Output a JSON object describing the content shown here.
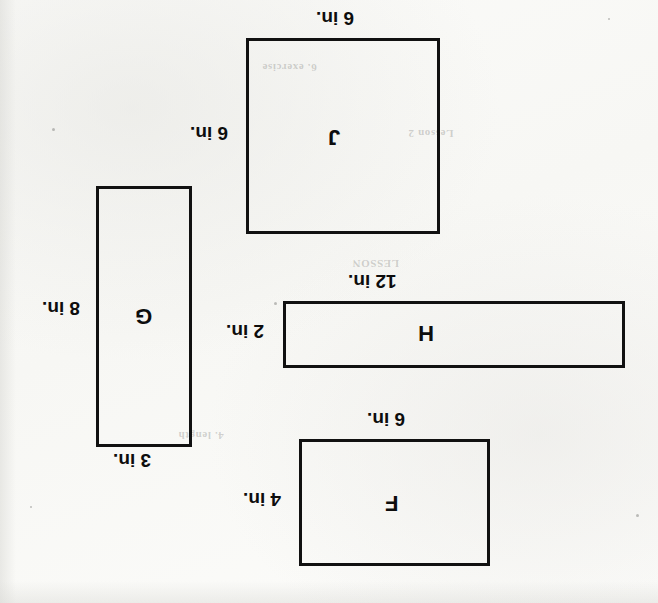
{
  "page": {
    "orientation": "upside-down-scan",
    "width": 658,
    "height": 603,
    "background_color": "#fdfdfb",
    "ink_color": "#111111"
  },
  "figures": [
    {
      "id": "figure-j",
      "letter": "J",
      "shape": "square",
      "top_label": "6 in.",
      "side_label": "6 in.",
      "box": {
        "x": 246,
        "y": 38,
        "w": 194,
        "h": 196
      }
    },
    {
      "id": "figure-g",
      "letter": "G",
      "shape": "rectangle",
      "top_label": "3 in.",
      "side_label": "8 in.",
      "box": {
        "x": 96,
        "y": 186,
        "w": 96,
        "h": 261
      }
    },
    {
      "id": "figure-h",
      "letter": "H",
      "shape": "rectangle",
      "top_label": "12 in.",
      "side_label": "2 in.",
      "box": {
        "x": 283,
        "y": 301,
        "w": 342,
        "h": 67
      }
    },
    {
      "id": "figure-f",
      "letter": "F",
      "shape": "rectangle",
      "top_label": "6 in.",
      "side_label": "4 in.",
      "box": {
        "x": 299,
        "y": 439,
        "w": 191,
        "h": 127
      }
    }
  ],
  "ghost_text": {
    "a": "6. exercise",
    "b": "Lesson 2",
    "c": "LESSON",
    "d": "4. length"
  }
}
